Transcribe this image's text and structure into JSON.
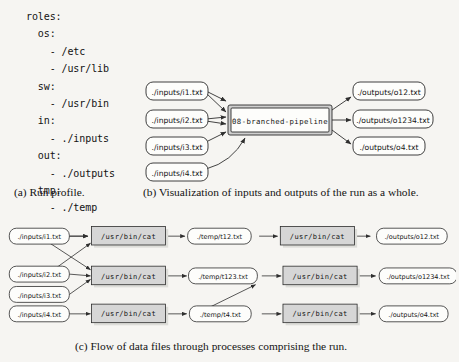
{
  "figure": {
    "background_color": "#f6f5f2",
    "ink_color": "#141414",
    "process_fill": "#d6d6d6",
    "node_fill": "#fdfdfb"
  },
  "panel_a": {
    "label": "(a)",
    "caption": "(a) Run profile.",
    "profile_text": "roles:\n  os:\n    - /etc\n    - /usr/lib\n  sw:\n    - /usr/bin\n  in:\n    - ./inputs\n  out:\n    - ./outputs\n  tmp:\n    - ./temp",
    "roles": {
      "os": [
        "/etc",
        "/usr/lib"
      ],
      "sw": [
        "/usr/bin"
      ],
      "in": [
        "./inputs"
      ],
      "out": [
        "./outputs"
      ],
      "tmp": [
        "./temp"
      ]
    }
  },
  "panel_b": {
    "label": "(b)",
    "caption": "(b) Visualization of inputs and outputs of the run as a whole.",
    "pipeline_label": "08-branched-pipeline",
    "inputs": [
      "./inputs/i1.txt",
      "./inputs/i2.txt",
      "./inputs/i3.txt",
      "./inputs/i4.txt"
    ],
    "outputs": [
      "./outputs/o12.txt",
      "./outputs/o1234.txt",
      "./outputs/o4.txt"
    ]
  },
  "panel_c": {
    "label": "(c)",
    "caption": "(c) Flow of data files through processes comprising the run.",
    "process_label": "/usr/bin/cat",
    "rows": [
      {
        "input": "./inputs/i1.txt",
        "process_1": "/usr/bin/cat",
        "temp": "./temp/t12.txt",
        "process_2": "/usr/bin/cat",
        "output": "./outputs/o12.txt"
      },
      {
        "input": "./inputs/i2.txt",
        "input_extra": "./inputs/i3.txt",
        "process_1": "/usr/bin/cat",
        "temp": "./temp/t123.txt",
        "process_2": "/usr/bin/cat",
        "output": "./outputs/o1234.txt"
      },
      {
        "input": "./inputs/i4.txt",
        "process_1": "/usr/bin/cat",
        "temp": "./temp/t4.txt",
        "process_2": "/usr/bin/cat",
        "output": "./outputs/o4.txt"
      }
    ],
    "inputs": [
      "./inputs/i1.txt",
      "./inputs/i2.txt",
      "./inputs/i3.txt",
      "./inputs/i4.txt"
    ],
    "temps": [
      "./temp/t12.txt",
      "./temp/t123.txt",
      "./temp/t4.txt"
    ],
    "outputs": [
      "./outputs/o12.txt",
      "./outputs/o1234.txt",
      "./outputs/o4.txt"
    ]
  }
}
